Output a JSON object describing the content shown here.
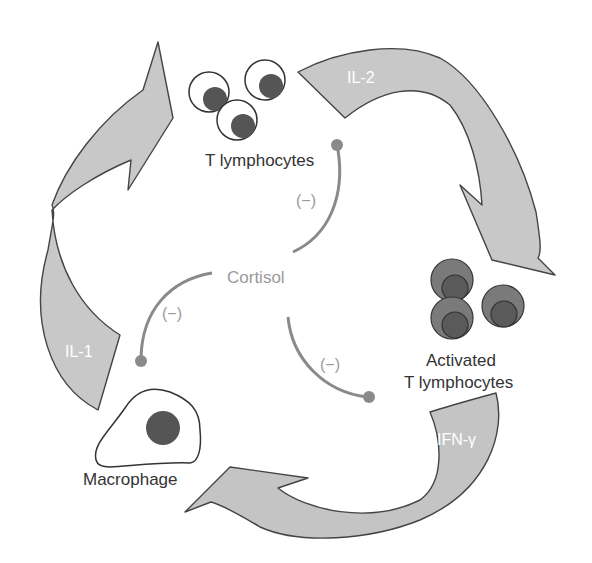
{
  "diagram": {
    "type": "cytokine-feedback-cycle",
    "colors": {
      "arrow_fill": "#c8c8c8",
      "arrow_fill_dark": "#bdbdbd",
      "arrow_stroke": "#444444",
      "cell_nucleus": "#555555",
      "activated_cell": "#7a7a7a",
      "activated_nucleus": "#5a5a5a",
      "inhibition_line": "#8a8a8a",
      "cortisol_text": "#9a9a9a",
      "cell_text": "#333333"
    },
    "nodes": {
      "t_lymphocytes": {
        "label": "T lymphocytes"
      },
      "activated_t_lymphocytes": {
        "label_line1": "Activated",
        "label_line2": "T lymphocytes"
      },
      "macrophage": {
        "label": "Macrophage"
      },
      "cortisol": {
        "label": "Cortisol"
      }
    },
    "arrows": [
      {
        "id": "il2",
        "label": "IL-2",
        "from": "T lymphocytes",
        "to": "Activated T lymphocytes"
      },
      {
        "id": "ifng",
        "label": "IFN-γ",
        "from": "Activated T lymphocytes",
        "to": "Macrophage"
      },
      {
        "id": "il1",
        "label": "IL-1",
        "from": "Macrophage",
        "to": "T lymphocytes"
      }
    ],
    "inhibitions": [
      {
        "from": "Cortisol",
        "to": "T lymphocytes",
        "sign": "(−)"
      },
      {
        "from": "Cortisol",
        "to": "Macrophage",
        "sign": "(−)"
      },
      {
        "from": "Cortisol",
        "to": "Activated T lymphocytes",
        "sign": "(−)"
      }
    ]
  }
}
